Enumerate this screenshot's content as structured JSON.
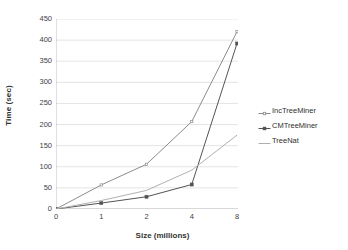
{
  "chart_data": {
    "type": "line",
    "title": "",
    "xlabel": "Size (millions)",
    "ylabel": "Time (sec)",
    "categories": [
      "0",
      "1",
      "2",
      "4",
      "8"
    ],
    "x": [
      0,
      1,
      2,
      4,
      8
    ],
    "ylim": [
      0,
      450
    ],
    "y_ticks": [
      0,
      50,
      100,
      150,
      200,
      250,
      300,
      350,
      400,
      450
    ],
    "x_tick_labels": [
      "0",
      "1",
      "2",
      "4",
      "8"
    ],
    "grid": "horizontal",
    "legend_position": "right",
    "series": [
      {
        "name": "IncTreeMiner",
        "color": "#8c8c8c",
        "marker": "tick",
        "values": [
          0,
          57,
          106,
          207,
          420
        ]
      },
      {
        "name": "CMTreeMiner",
        "color": "#545454",
        "marker": "square",
        "values": [
          0,
          14,
          29,
          58,
          392
        ]
      },
      {
        "name": "TreeNat",
        "color": "#b0b0b0",
        "marker": "none",
        "values": [
          0,
          20,
          44,
          92,
          175
        ]
      }
    ]
  },
  "legend": {
    "items": [
      {
        "label": "IncTreeMiner"
      },
      {
        "label": "CMTreeMiner"
      },
      {
        "label": "TreeNat"
      }
    ]
  },
  "colors": {
    "grid": "#d9d9d9",
    "axis": "#b3b3b3",
    "text": "#3f3f3f",
    "background": "#ffffff"
  }
}
